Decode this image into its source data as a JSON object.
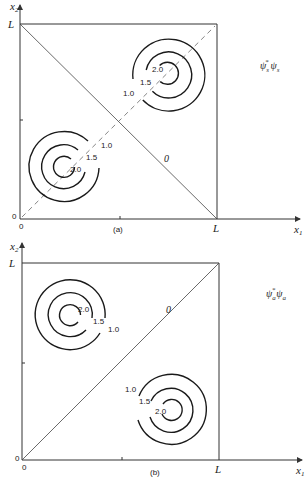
{
  "panels": [
    {
      "id": "a",
      "caption": "(a)",
      "function_label": {
        "base": "ψ",
        "sub1": "s",
        "sup1": "*",
        "base2": "ψ",
        "sub2": "s",
        "text": "ψs* ψs"
      },
      "x_axis_label": "x",
      "x_axis_sub": "1",
      "y_axis_label": "x",
      "y_axis_sub": "2",
      "y_tick_L": "L",
      "x_tick_L": "L",
      "origin_y": "0",
      "origin_x": "0",
      "node_line_label": "0",
      "node_line": "x1 + x2 = L (antidiagonal)",
      "symmetry_line": "x1 = x2 (dashed)",
      "contour_groups": [
        {
          "position": "upper-right",
          "levels": [
            "2.0",
            "1.5",
            "1.0"
          ]
        },
        {
          "position": "lower-left",
          "levels": [
            "2.0",
            "1.5",
            "1.0"
          ]
        }
      ]
    },
    {
      "id": "b",
      "caption": "(b)",
      "function_label": {
        "base": "ψ",
        "sub1": "a",
        "sup1": "*",
        "base2": "ψ",
        "sub2": "a",
        "text": "ψa* ψa"
      },
      "x_axis_label": "x",
      "x_axis_sub": "1",
      "y_axis_label": "x",
      "y_axis_sub": "2",
      "y_tick_L": "L",
      "x_tick_L": "L",
      "origin_y": "0",
      "origin_x": "0",
      "node_line_label": "0",
      "node_line": "x1 = x2 (diagonal)",
      "contour_groups": [
        {
          "position": "upper-left",
          "levels": [
            "2.0",
            "1.5",
            "1.0"
          ]
        },
        {
          "position": "lower-right",
          "levels": [
            "2.0",
            "1.5",
            "1.0"
          ]
        }
      ]
    }
  ]
}
